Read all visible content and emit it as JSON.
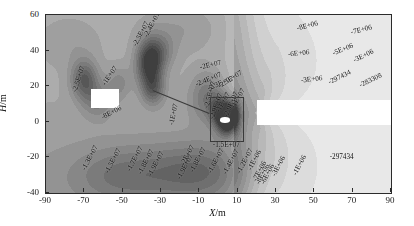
{
  "figure": {
    "background": "#ffffff",
    "frame_color": "#2b2b2b",
    "plot_left_px": 45,
    "plot_top_px": 14,
    "plot_width_px": 345,
    "plot_height_px": 178
  },
  "axes": {
    "x_title_prefix": "X",
    "x_title_suffix": "/m",
    "y_title_prefix": "H",
    "y_title_suffix": "/m",
    "x_ticks": [
      "-90",
      "-70",
      "-50",
      "-30",
      "-10",
      "10",
      "30",
      "50",
      "70",
      "90"
    ],
    "x_tick_values": [
      -90,
      -70,
      -50,
      -30,
      -10,
      10,
      30,
      50,
      70,
      90
    ],
    "y_ticks": [
      "60",
      "40",
      "20",
      "0",
      "-20",
      "-40"
    ],
    "y_tick_values": [
      60,
      40,
      20,
      0,
      -20,
      -40
    ],
    "xlim": [
      -90,
      90
    ],
    "ylim": [
      -40,
      60
    ]
  },
  "chart_data": {
    "type": "heatmap",
    "title": "",
    "subtitle": "",
    "xlabel": "X/m",
    "ylabel": "H/m",
    "xlim": [
      -90,
      90
    ],
    "ylim": [
      -40,
      60
    ],
    "grid": false,
    "legend": "none",
    "colormap": "grayscale",
    "value_units": "",
    "value_range": [
      -25000000,
      -283308
    ],
    "contour_levels": [
      -25000000,
      -24000000,
      -23000000,
      -20000000,
      -19000000,
      -18000000,
      -17000000,
      -16000000,
      -15000000,
      -14000000,
      -13000000,
      -12000000,
      -10000000,
      -8000000,
      -7000000,
      -6000000,
      -5000000,
      -3000000,
      -1000000,
      -297434,
      -283308
    ],
    "contour_labels": [
      {
        "text": "-2.5E+07",
        "x": -75.0,
        "y": 17.0,
        "rot": -72
      },
      {
        "text": "-1E+07",
        "x": -59.5,
        "y": 20.5,
        "rot": -55
      },
      {
        "text": "-8E+06",
        "x": -61.0,
        "y": 2.0,
        "rot": -27
      },
      {
        "text": "-2.5E+07",
        "x": -43.5,
        "y": 42.5,
        "rot": -62
      },
      {
        "text": "-2.4E+07",
        "x": -38.0,
        "y": 47.5,
        "rot": -62
      },
      {
        "text": "-1E+07",
        "x": -24.5,
        "y": -2.0,
        "rot": -78
      },
      {
        "text": "-2E+07",
        "x": -9.5,
        "y": 30.0,
        "rot": -13
      },
      {
        "text": "-2.4E+07",
        "x": -11.5,
        "y": 20.5,
        "rot": -22
      },
      {
        "text": "-2.3E+07",
        "x": -5.5,
        "y": 18.5,
        "rot": -22
      },
      {
        "text": "-2.5E+07",
        "x": 0.5,
        "y": 19.5,
        "rot": -32
      },
      {
        "text": "-2.5E+07",
        "x": -6.0,
        "y": 7.5,
        "rot": -75
      },
      {
        "text": "-2.9E+07",
        "x": -3.5,
        "y": 1.5,
        "rot": -70
      },
      {
        "text": "-1E+07",
        "x": -0.5,
        "y": 5.5,
        "rot": -60
      },
      {
        "text": "-2.9E+07",
        "x": 4.0,
        "y": 2.5,
        "rot": -66
      },
      {
        "text": "-1E+07",
        "x": 7.5,
        "y": 7.5,
        "rot": -60
      },
      {
        "text": "-1.5E+07",
        "x": -3.0,
        "y": -13.5,
        "rot": 0
      },
      {
        "text": "-1.3E+07",
        "x": -70.0,
        "y": -27.0,
        "rot": -62
      },
      {
        "text": "-1.5E+07",
        "x": -58.0,
        "y": -29.0,
        "rot": -62
      },
      {
        "text": "-1.7E+07",
        "x": -46.5,
        "y": -27.5,
        "rot": -62
      },
      {
        "text": "-1.8E+07",
        "x": -41.0,
        "y": -29.5,
        "rot": -62
      },
      {
        "text": "-1.9E+07",
        "x": -35.5,
        "y": -30.5,
        "rot": -62
      },
      {
        "text": "-1.9E+07",
        "x": -20.5,
        "y": -32.0,
        "rot": -62
      },
      {
        "text": "-2E+07",
        "x": -18.5,
        "y": -24.5,
        "rot": -62
      },
      {
        "text": "-1.8E+07",
        "x": -14.0,
        "y": -28.0,
        "rot": -62
      },
      {
        "text": "-1.6E+07",
        "x": -4.5,
        "y": -29.0,
        "rot": -62
      },
      {
        "text": "-1.4E+07",
        "x": 3.5,
        "y": -29.5,
        "rot": -62
      },
      {
        "text": "-1.2E+07",
        "x": 10.5,
        "y": -28.5,
        "rot": -62
      },
      {
        "text": "-1E+06",
        "x": 16.5,
        "y": -27.0,
        "rot": -62
      },
      {
        "text": "-8E+06",
        "x": 20.5,
        "y": -35.0,
        "rot": -62
      },
      {
        "text": "-6E+06",
        "x": 23.0,
        "y": -35.0,
        "rot": -62
      },
      {
        "text": "-7E+06",
        "x": 19.0,
        "y": -33.0,
        "rot": -62
      },
      {
        "text": "-3E+06",
        "x": 29.0,
        "y": -30.5,
        "rot": -62
      },
      {
        "text": "-1E+06",
        "x": 40.0,
        "y": -30.0,
        "rot": -62
      },
      {
        "text": "-297434",
        "x": 58.0,
        "y": -20.5,
        "rot": 0
      },
      {
        "text": "-8E+06",
        "x": 41.0,
        "y": 52.0,
        "rot": -14
      },
      {
        "text": "-7E+06",
        "x": 69.0,
        "y": 50.0,
        "rot": -14
      },
      {
        "text": "-6E+06",
        "x": 36.0,
        "y": 37.5,
        "rot": -6
      },
      {
        "text": "-5E+06",
        "x": 59.5,
        "y": 38.0,
        "rot": -22
      },
      {
        "text": "-3E+06",
        "x": 70.5,
        "y": 34.0,
        "rot": -26
      },
      {
        "text": "-3E+06",
        "x": 43.0,
        "y": 23.0,
        "rot": -6
      },
      {
        "text": "-297434",
        "x": 57.5,
        "y": 22.0,
        "rot": -26
      },
      {
        "text": "-283308",
        "x": 74.0,
        "y": 20.0,
        "rot": -26
      }
    ],
    "masked_regions": [
      {
        "name": "left-white-rectangle",
        "x0": -66.5,
        "x1": -52.0,
        "y0": 7.5,
        "y1": 18.5
      },
      {
        "name": "right-white-band",
        "x0": 20.0,
        "x1": 90.0,
        "y0": -2.0,
        "y1": 12.0
      },
      {
        "name": "center-white-ellipse",
        "x0": 1.0,
        "x1": 6.0,
        "y0": -0.5,
        "y1": 2.5
      }
    ],
    "inset_zoom_box": {
      "x0": -4.5,
      "x1": 12.0,
      "y0": -10.0,
      "y1": 14.0
    },
    "leader_line": {
      "x0": -34.0,
      "y0": 18.0,
      "x1": -4.5,
      "y1": 5.0
    }
  }
}
